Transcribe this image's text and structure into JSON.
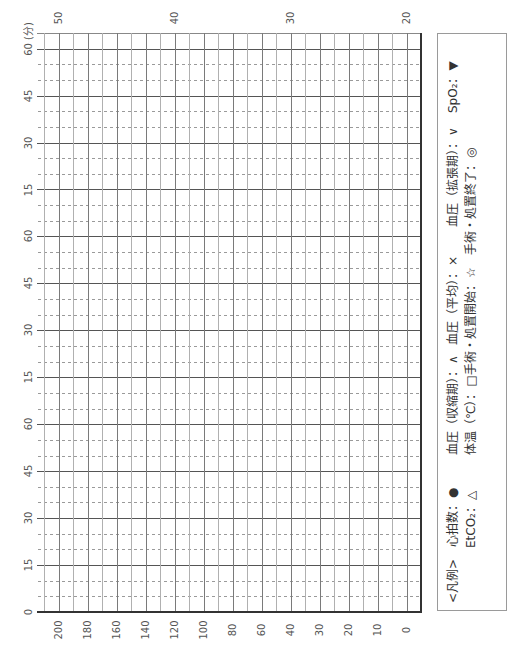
{
  "chart_data": {
    "type": "table",
    "title": "",
    "time_axis": {
      "unit": "分",
      "labels": [
        "60 (分)",
        "45",
        "30",
        "15",
        "60",
        "45",
        "30",
        "15",
        "60",
        "45",
        "30",
        "15",
        "0"
      ],
      "major_interval_min": 15,
      "minor_interval_min": 5
    },
    "value_axis_bottom": {
      "labels": [
        "200",
        "180",
        "160",
        "140",
        "120",
        "100",
        "80",
        "60",
        "40",
        "30",
        "20",
        "10",
        "0"
      ]
    },
    "temperature_axis_top": {
      "labels": [
        "50",
        "40",
        "30",
        "20"
      ]
    },
    "grid": {
      "columns": 26,
      "rows": 37,
      "major_row_every": 3,
      "minor_rows_dashed": true
    }
  },
  "legend": {
    "title": "<凡例>",
    "separator": "：",
    "items": [
      {
        "label": "心拍数",
        "symbol": "●"
      },
      {
        "label": "血圧（収縮期）",
        "symbol": "∧"
      },
      {
        "label": "血圧（平均）",
        "symbol": "×"
      },
      {
        "label": "血圧（拡張期）",
        "symbol": "∨"
      },
      {
        "label": "SpO₂",
        "symbol": "▼"
      },
      {
        "label": "EtCO₂",
        "symbol": "△"
      },
      {
        "label": "体温（℃）",
        "symbol": "□"
      },
      {
        "label": "手術・処置開始",
        "symbol": "☆"
      },
      {
        "label": "手術・処置終了",
        "symbol": "◎"
      }
    ]
  },
  "colors": {
    "major_line": "#555555",
    "minor_line": "#9a9a9a",
    "border": "#333333",
    "text": "#555555"
  }
}
